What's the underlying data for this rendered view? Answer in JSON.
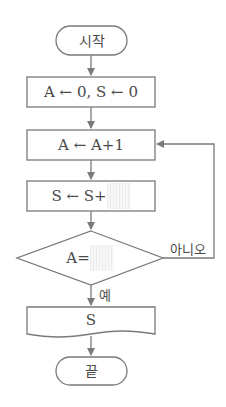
{
  "diagram": {
    "type": "flowchart",
    "colors": {
      "stroke": "#7a7a7a",
      "text": "#4a4a4a",
      "blank_fill": "#ececec"
    },
    "nodes": [
      {
        "id": "start",
        "shape": "terminal",
        "label": "시작"
      },
      {
        "id": "init",
        "shape": "process",
        "label": "A ← 0, S ← 0"
      },
      {
        "id": "increment",
        "shape": "process",
        "label": "A ← A+1"
      },
      {
        "id": "accumulate",
        "shape": "process",
        "label_prefix": "S ← S+",
        "blank": true
      },
      {
        "id": "check",
        "shape": "decision",
        "label_prefix": "A=",
        "blank": true
      },
      {
        "id": "output",
        "shape": "output",
        "label": "S"
      },
      {
        "id": "end",
        "shape": "terminal",
        "label": "끝"
      }
    ],
    "edges": [
      {
        "from": "start",
        "to": "init"
      },
      {
        "from": "init",
        "to": "increment"
      },
      {
        "from": "increment",
        "to": "accumulate"
      },
      {
        "from": "accumulate",
        "to": "check"
      },
      {
        "from": "check",
        "to": "output",
        "label": "예"
      },
      {
        "from": "check",
        "to": "increment",
        "label": "아니오"
      },
      {
        "from": "output",
        "to": "end"
      }
    ]
  }
}
